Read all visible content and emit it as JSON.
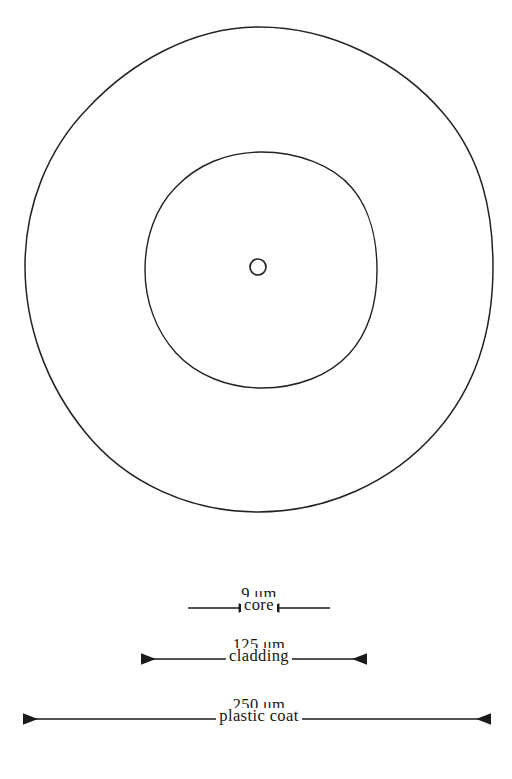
{
  "figure": {
    "background_color": "#ffffff",
    "line_color": "#1a1a1a",
    "units_symbol": "μm"
  },
  "cross_section": {
    "layers": [
      {
        "id": "plastic-coat",
        "name": "plastic coat",
        "diameter_value": "250",
        "diameter_unit": "μm",
        "diameter_label": "250 μm",
        "center_x": 259,
        "center_y": 269,
        "radius_x": 234,
        "radius_y": 242
      },
      {
        "id": "cladding",
        "name": "cladding",
        "diameter_value": "125",
        "diameter_unit": "μm",
        "diameter_label": "125 μm",
        "center_x": 261,
        "center_y": 270,
        "radius_x": 116,
        "radius_y": 118
      },
      {
        "id": "core",
        "name": "core",
        "diameter_value": "9",
        "diameter_unit": "μm",
        "diameter_label": "9 μm",
        "center_x": 258,
        "center_y": 267,
        "radius_x": 8,
        "radius_y": 8
      }
    ]
  },
  "dimensions": [
    {
      "id": "core-dimension",
      "value_label": "9 μm",
      "name_label": "core",
      "arrow_direction": "inward",
      "line_y": 608,
      "x_start": 188,
      "x_end": 330,
      "gap_left": 252,
      "gap_right": 266
    },
    {
      "id": "cladding-dimension",
      "value_label": "125 μm",
      "name_label": "cladding",
      "arrow_direction": "outward",
      "line_y": 659,
      "x_start": 140,
      "x_end": 368
    },
    {
      "id": "plastic-coat-dimension",
      "value_label": "250 μm",
      "name_label": "plastic coat",
      "arrow_direction": "outward",
      "line_y": 719,
      "x_start": 22,
      "x_end": 492
    }
  ]
}
